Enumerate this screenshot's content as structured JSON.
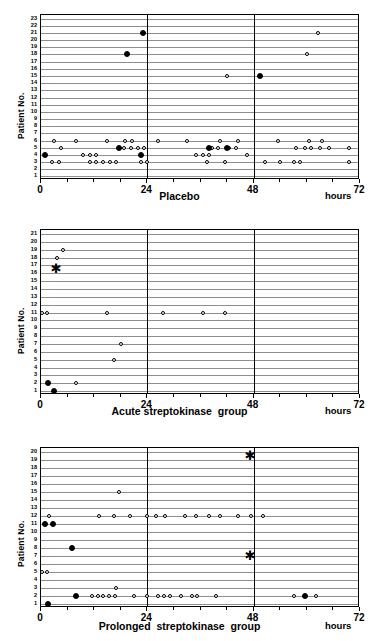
{
  "figure": {
    "y_axis_title": "Patient No.",
    "x_unit_label": "hours",
    "x_ticks": [
      "0",
      "24",
      "48",
      "72"
    ],
    "marker_legend": {
      "open_circle": "open-circle-event",
      "filled_circle": "filled-circle-event",
      "asterisk": "asterisk-event"
    },
    "colors": {
      "axis": "#000000",
      "gridline": "#8e8e8e",
      "marker_fill": "#000000",
      "background": "#ffffff"
    }
  },
  "chart_data": [
    {
      "type": "scatter",
      "title": "Placebo",
      "xlabel": "hours",
      "ylabel": "Patient No.",
      "xlim": [
        0,
        72
      ],
      "ylim": [
        1,
        23
      ],
      "xticks": [
        0,
        24,
        48,
        72
      ],
      "yticks": [
        1,
        2,
        3,
        4,
        5,
        6,
        7,
        8,
        9,
        10,
        11,
        12,
        13,
        14,
        15,
        16,
        17,
        18,
        19,
        20,
        21,
        22,
        23
      ],
      "grid": true,
      "vertical_reference_lines": [
        24,
        48
      ],
      "series": [
        {
          "name": "open-circle",
          "marker": "open",
          "points": [
            [
              3.0,
              6
            ],
            [
              8.0,
              6
            ],
            [
              15.0,
              6
            ],
            [
              19.0,
              6
            ],
            [
              20.5,
              6
            ],
            [
              26.5,
              6
            ],
            [
              4.5,
              5
            ],
            [
              18.8,
              5
            ],
            [
              20.3,
              5
            ],
            [
              21.8,
              5
            ],
            [
              23.3,
              5
            ],
            [
              2.5,
              3
            ],
            [
              4.0,
              3
            ],
            [
              11.0,
              3
            ],
            [
              12.5,
              3
            ],
            [
              14.0,
              3
            ],
            [
              15.5,
              3
            ],
            [
              17.0,
              3
            ],
            [
              22.5,
              3
            ],
            [
              24.0,
              3
            ],
            [
              9.5,
              4
            ],
            [
              11.0,
              4
            ],
            [
              12.5,
              4
            ],
            [
              33.0,
              6
            ],
            [
              40.5,
              6
            ],
            [
              44.5,
              6
            ],
            [
              38.5,
              5
            ],
            [
              40.0,
              5
            ],
            [
              42.5,
              5
            ],
            [
              44.0,
              5
            ],
            [
              35.0,
              4
            ],
            [
              36.5,
              4
            ],
            [
              38.0,
              4
            ],
            [
              46.5,
              4
            ],
            [
              37.5,
              3
            ],
            [
              41.5,
              3
            ],
            [
              42.0,
              15
            ],
            [
              53.5,
              6
            ],
            [
              60.5,
              6
            ],
            [
              63.5,
              6
            ],
            [
              57.5,
              5
            ],
            [
              59.5,
              5
            ],
            [
              61.0,
              5
            ],
            [
              63.0,
              5
            ],
            [
              65.0,
              5
            ],
            [
              69.5,
              5
            ],
            [
              50.5,
              3
            ],
            [
              54.0,
              3
            ],
            [
              57.0,
              3
            ],
            [
              58.5,
              3
            ],
            [
              69.5,
              3
            ],
            [
              62.5,
              21
            ],
            [
              60.0,
              18
            ]
          ]
        },
        {
          "name": "filled-circle",
          "marker": "filled",
          "points": [
            [
              23.0,
              21
            ],
            [
              19.5,
              18
            ],
            [
              49.5,
              15
            ],
            [
              1.0,
              4
            ],
            [
              22.5,
              4
            ],
            [
              17.5,
              5
            ],
            [
              38.0,
              5
            ],
            [
              42.0,
              5
            ]
          ]
        }
      ]
    },
    {
      "type": "scatter",
      "title": "Acute streptokinase  group",
      "xlabel": "hours",
      "ylabel": "Patient No.",
      "xlim": [
        0,
        72
      ],
      "ylim": [
        1,
        21
      ],
      "xticks": [
        0,
        24,
        48,
        72
      ],
      "yticks": [
        1,
        2,
        3,
        4,
        5,
        6,
        7,
        8,
        9,
        10,
        11,
        12,
        13,
        14,
        15,
        16,
        17,
        18,
        19,
        20,
        21
      ],
      "grid": true,
      "vertical_reference_lines": [
        24,
        48
      ],
      "series": [
        {
          "name": "open-circle",
          "marker": "open",
          "points": [
            [
              5.0,
              19
            ],
            [
              3.5,
              18
            ],
            [
              0.3,
              11
            ],
            [
              1.3,
              11
            ],
            [
              15.0,
              11
            ],
            [
              27.5,
              11
            ],
            [
              36.5,
              11
            ],
            [
              41.5,
              11
            ],
            [
              18.0,
              7
            ],
            [
              16.5,
              5
            ],
            [
              8.0,
              2
            ]
          ]
        },
        {
          "name": "filled-circle",
          "marker": "filled",
          "points": [
            [
              1.5,
              2
            ],
            [
              3.0,
              1
            ]
          ]
        },
        {
          "name": "asterisk",
          "marker": "star",
          "points": [
            [
              3.2,
              16.5
            ]
          ]
        }
      ]
    },
    {
      "type": "scatter",
      "title": "Prolonged  streptokinase  group",
      "xlabel": "hours",
      "ylabel": "Patient No.",
      "xlim": [
        0,
        72
      ],
      "ylim": [
        1,
        20
      ],
      "xticks": [
        0,
        24,
        48,
        72
      ],
      "yticks": [
        1,
        2,
        3,
        4,
        5,
        6,
        7,
        8,
        9,
        10,
        11,
        12,
        13,
        14,
        15,
        16,
        17,
        18,
        19,
        20
      ],
      "grid": true,
      "vertical_reference_lines": [
        24,
        48
      ],
      "series": [
        {
          "name": "open-circle",
          "marker": "open",
          "points": [
            [
              17.5,
              15
            ],
            [
              1.8,
              12
            ],
            [
              13.0,
              12
            ],
            [
              16.5,
              12
            ],
            [
              20.0,
              12
            ],
            [
              24.0,
              12
            ],
            [
              26.0,
              12
            ],
            [
              28.0,
              12
            ],
            [
              32.5,
              12
            ],
            [
              35.0,
              12
            ],
            [
              38.0,
              12
            ],
            [
              40.5,
              12
            ],
            [
              44.5,
              12
            ],
            [
              47.5,
              12
            ],
            [
              50.0,
              12
            ],
            [
              0.3,
              5
            ],
            [
              1.3,
              5
            ],
            [
              17.0,
              3
            ],
            [
              11.5,
              2
            ],
            [
              12.8,
              2
            ],
            [
              14.1,
              2
            ],
            [
              15.4,
              2
            ],
            [
              16.7,
              2
            ],
            [
              21.0,
              2
            ],
            [
              24.0,
              2
            ],
            [
              26.5,
              2
            ],
            [
              27.8,
              2
            ],
            [
              29.1,
              2
            ],
            [
              31.5,
              2
            ],
            [
              34.0,
              2
            ],
            [
              35.3,
              2
            ],
            [
              39.5,
              2
            ],
            [
              57.0,
              2
            ],
            [
              62.0,
              2
            ]
          ]
        },
        {
          "name": "filled-circle",
          "marker": "filled",
          "points": [
            [
              0.8,
              11
            ],
            [
              2.6,
              11
            ],
            [
              7.0,
              8
            ],
            [
              1.5,
              1
            ],
            [
              8.0,
              2
            ],
            [
              59.5,
              2
            ]
          ]
        },
        {
          "name": "asterisk",
          "marker": "star",
          "points": [
            [
              47.0,
              19.5
            ],
            [
              47.0,
              7
            ]
          ]
        }
      ]
    }
  ]
}
